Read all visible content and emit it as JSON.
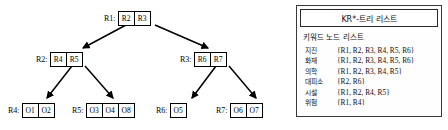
{
  "diagram": {
    "type": "tree",
    "nodes": [
      {
        "id": "R1",
        "label": "R1:",
        "entries": [
          "R2",
          "R3"
        ],
        "level": 0,
        "x": 120,
        "y": 11
      },
      {
        "id": "R2",
        "label": "R2:",
        "entries": [
          "R4",
          "R5"
        ],
        "level": 1,
        "x": 52,
        "y": 52
      },
      {
        "id": "R3",
        "label": "R3:",
        "entries": [
          "R6",
          "R7"
        ],
        "level": 1,
        "x": 196,
        "y": 52
      },
      {
        "id": "R4",
        "label": "R4:",
        "entries": [
          "O1",
          "O2"
        ],
        "level": 2,
        "x": 24,
        "y": 103
      },
      {
        "id": "R5",
        "label": "R5:",
        "entries": [
          "O3",
          "O4",
          "O8"
        ],
        "level": 2,
        "x": 88,
        "y": 103
      },
      {
        "id": "R6",
        "label": "R6:",
        "entries": [
          "O5"
        ],
        "level": 2,
        "x": 172,
        "y": 103
      },
      {
        "id": "R7",
        "label": "R7:",
        "entries": [
          "O6",
          "O7"
        ],
        "level": 2,
        "x": 232,
        "y": 103
      }
    ],
    "edges": [
      {
        "from": "R1",
        "to": "R2"
      },
      {
        "from": "R1",
        "to": "R3"
      },
      {
        "from": "R2",
        "to": "R4"
      },
      {
        "from": "R2",
        "to": "R5"
      },
      {
        "from": "R3",
        "to": "R6"
      },
      {
        "from": "R3",
        "to": "R7"
      }
    ]
  },
  "legend": {
    "title": "KR*-트리 리스트",
    "subtitle": "키워드 노드 리스트",
    "columns": [
      "키워드",
      "노드 리스트"
    ],
    "rows": [
      {
        "keyword": "지진",
        "nodes": "{R1, R2, R3, R4, R5, R6}"
      },
      {
        "keyword": "화재",
        "nodes": "{R1, R2, R3, R4, R5, R6}"
      },
      {
        "keyword": "의학",
        "nodes": "{R1, R2, R3, R4, R5}"
      },
      {
        "keyword": "대피소",
        "nodes": "{R2, R6}"
      },
      {
        "keyword": "시설",
        "nodes": "{R1, R2, R4, R5}"
      },
      {
        "keyword": "위험",
        "nodes": "{R1, R4}"
      }
    ]
  },
  "colors": {
    "stroke": "#000000",
    "panel_border": "#3a3a3a",
    "background": "#ffffff",
    "text": "#111111"
  }
}
